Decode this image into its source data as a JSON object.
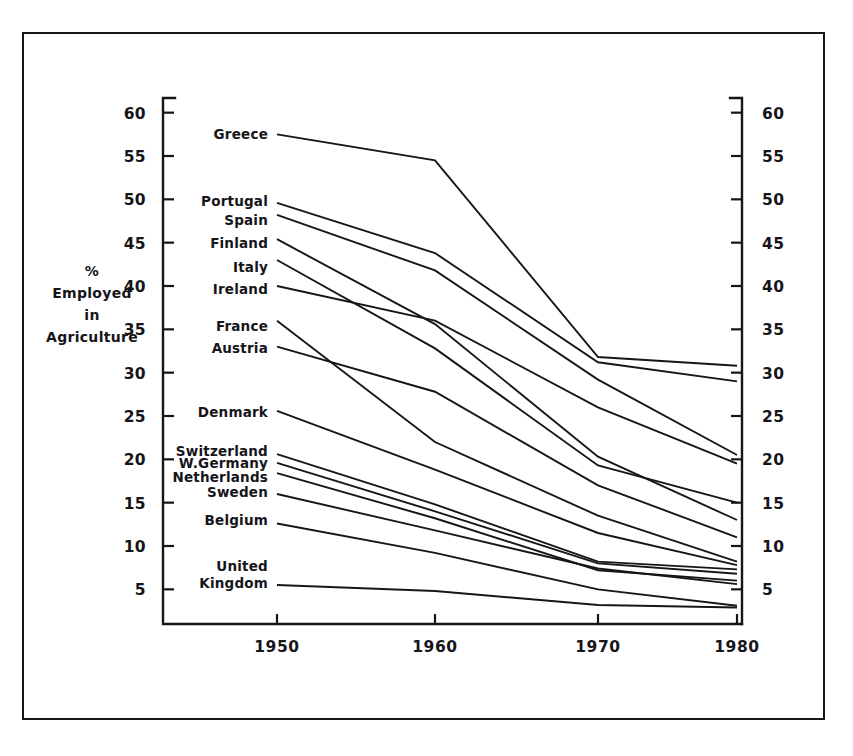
{
  "chart_data": {
    "type": "line",
    "title": "",
    "xlabel": "",
    "ylabel": "% Employed in Agriculture",
    "ylabel_lines": [
      "%",
      "Employed",
      "in",
      "Agriculture"
    ],
    "x": [
      1950,
      1960,
      1970,
      1980
    ],
    "xtick_labels": [
      "1950",
      "1960",
      "1970",
      "1980"
    ],
    "ytick_labels": [
      "60",
      "55",
      "50",
      "45",
      "40",
      "35",
      "30",
      "25",
      "20",
      "15",
      "10",
      "5"
    ],
    "ytick_values": [
      60,
      55,
      50,
      45,
      40,
      35,
      30,
      25,
      20,
      15,
      10,
      5
    ],
    "ylim": [
      1,
      61
    ],
    "xlim": [
      1947,
      1981
    ],
    "grid": false,
    "legend": "inline-left-labels",
    "axis_right_mirror": true,
    "line_color": "#16151a",
    "series": [
      {
        "name": "Greece",
        "label": "Greece",
        "values": [
          57.5,
          54.5,
          31.8,
          30.8
        ],
        "label_y": 57.5
      },
      {
        "name": "Portugal",
        "label": "Portugal",
        "values": [
          49.6,
          43.8,
          31.2,
          29.0
        ],
        "label_y": 49.8
      },
      {
        "name": "Spain",
        "label": "Spain",
        "values": [
          48.2,
          41.8,
          29.2,
          20.5
        ],
        "label_y": 47.6
      },
      {
        "name": "Finland",
        "label": "Finland",
        "values": [
          45.4,
          35.6,
          20.3,
          13.0
        ],
        "label_y": 45.0
      },
      {
        "name": "Italy",
        "label": "Italy",
        "values": [
          43.0,
          32.8,
          19.3,
          15.0
        ],
        "label_y": 42.2
      },
      {
        "name": "Ireland",
        "label": "Ireland",
        "values": [
          40.0,
          36.0,
          26.0,
          19.5
        ],
        "label_y": 39.6
      },
      {
        "name": "France",
        "label": "France",
        "values": [
          36.0,
          22.0,
          13.5,
          8.2
        ],
        "label_y": 35.4
      },
      {
        "name": "Austria",
        "label": "Austria",
        "values": [
          33.0,
          27.8,
          17.0,
          11.0
        ],
        "label_y": 32.8
      },
      {
        "name": "Denmark",
        "label": "Denmark",
        "values": [
          25.6,
          18.8,
          11.5,
          7.8
        ],
        "label_y": 25.5
      },
      {
        "name": "Switzerland",
        "label": "Switzerland",
        "values": [
          20.6,
          14.8,
          8.2,
          7.3
        ],
        "label_y": 21.0
      },
      {
        "name": "W.Germany",
        "label": "W.Germany",
        "values": [
          19.6,
          14.0,
          8.0,
          6.8
        ],
        "label_y": 19.6
      },
      {
        "name": "Netherlands",
        "label": "Netherlands",
        "values": [
          18.4,
          13.2,
          7.2,
          6.0
        ],
        "label_y": 18.0
      },
      {
        "name": "Sweden",
        "label": "Sweden",
        "values": [
          16.0,
          11.8,
          7.4,
          5.6
        ],
        "label_y": 16.2
      },
      {
        "name": "Belgium",
        "label": "Belgium",
        "values": [
          12.6,
          9.2,
          5.0,
          3.1
        ],
        "label_y": 13.0
      },
      {
        "name": "United Kingdom",
        "label": "United",
        "label2": "Kingdom",
        "values": [
          5.5,
          4.8,
          3.2,
          2.9
        ],
        "label_y": 6.4
      }
    ]
  },
  "axis": {
    "left_title_x": 92,
    "right_axis_label": "mirror"
  }
}
